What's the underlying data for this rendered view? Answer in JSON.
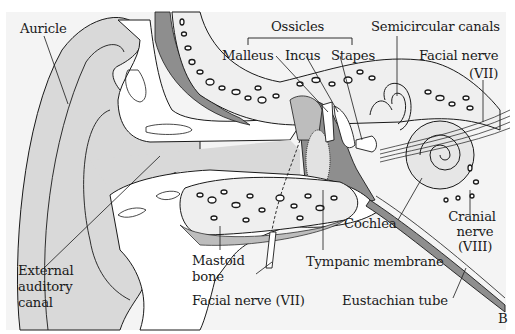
{
  "diagram": {
    "type": "anatomical-cross-section",
    "panel_letter": "B",
    "colors": {
      "background": "#ffffff",
      "plate": "#f4f4f4",
      "light_gray": "#d9d9d9",
      "mid_gray": "#bdbdbd",
      "dark_gray": "#8e8e8e",
      "bone_fill": "#efefef",
      "line": "#1a1a1a"
    },
    "labels": {
      "auricle": "Auricle",
      "ossicles": "Ossicles",
      "malleus": "Malleus",
      "incus": "Incus",
      "stapes": "Stapes",
      "semicircular_canals": "Semicircular canals",
      "facial_nerve_top_1": "Facial nerve",
      "facial_nerve_top_2": "(VII)",
      "external_canal_1": "External",
      "external_canal_2": "auditory",
      "external_canal_3": "canal",
      "mastoid_1": "Mastoid",
      "mastoid_2": "bone",
      "facial_nerve_bottom": "Facial nerve (VII)",
      "tympanic_membrane": "Tympanic membrane",
      "cochlea": "Cochlea",
      "cranial_nerve_1": "Cranial",
      "cranial_nerve_2": "nerve",
      "cranial_nerve_3": "(VIII)",
      "eustachian_tube": "Eustachian tube"
    }
  }
}
